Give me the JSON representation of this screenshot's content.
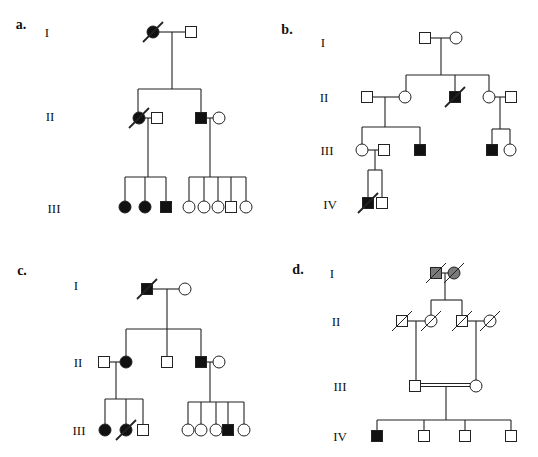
{
  "figure": {
    "colors": {
      "line": "#222222",
      "affected": "#111111",
      "carrier_gray": "#7a7a7a",
      "unaffected": "#ffffff"
    }
  },
  "panels": [
    {
      "id": "a",
      "label": "a.",
      "label_pos": [
        21,
        25
      ],
      "generations": [
        {
          "label": "I",
          "pos": [
            47,
            32
          ]
        },
        {
          "label": "II",
          "pos": [
            50,
            116
          ]
        },
        {
          "label": "III",
          "pos": [
            54,
            208
          ]
        }
      ],
      "individuals": [
        {
          "id": "a-I-1",
          "sex": "female",
          "affected": true,
          "deceased": true,
          "x": 153,
          "y": 32
        },
        {
          "id": "a-I-2",
          "sex": "male",
          "affected": false,
          "deceased": false,
          "x": 191,
          "y": 32
        },
        {
          "id": "a-II-1",
          "sex": "female",
          "affected": true,
          "deceased": true,
          "x": 139,
          "y": 118
        },
        {
          "id": "a-II-2",
          "sex": "male",
          "affected": false,
          "deceased": false,
          "x": 157,
          "y": 118
        },
        {
          "id": "a-II-3",
          "sex": "male",
          "affected": true,
          "deceased": false,
          "x": 201,
          "y": 118
        },
        {
          "id": "a-II-4",
          "sex": "female",
          "affected": false,
          "deceased": false,
          "x": 219,
          "y": 118
        },
        {
          "id": "a-III-1",
          "sex": "female",
          "affected": true,
          "deceased": false,
          "x": 125,
          "y": 207
        },
        {
          "id": "a-III-2",
          "sex": "female",
          "affected": true,
          "deceased": false,
          "x": 145,
          "y": 207
        },
        {
          "id": "a-III-3",
          "sex": "male",
          "affected": true,
          "deceased": false,
          "x": 166,
          "y": 207
        },
        {
          "id": "a-III-4",
          "sex": "female",
          "affected": false,
          "deceased": false,
          "x": 189,
          "y": 207
        },
        {
          "id": "a-III-5",
          "sex": "female",
          "affected": false,
          "deceased": false,
          "x": 204,
          "y": 207
        },
        {
          "id": "a-III-6",
          "sex": "female",
          "affected": false,
          "deceased": false,
          "x": 218,
          "y": 207
        },
        {
          "id": "a-III-7",
          "sex": "male",
          "affected": false,
          "deceased": false,
          "x": 231,
          "y": 207
        },
        {
          "id": "a-III-8",
          "sex": "female",
          "affected": false,
          "deceased": false,
          "x": 246,
          "y": 207
        }
      ],
      "lines": [
        [
          158,
          32,
          186,
          32
        ],
        [
          172,
          32,
          172,
          89
        ],
        [
          138,
          89,
          201,
          89
        ],
        [
          138,
          89,
          138,
          113
        ],
        [
          201,
          89,
          201,
          113
        ],
        [
          144,
          118,
          152,
          118
        ],
        [
          148,
          118,
          148,
          177
        ],
        [
          125,
          177,
          166,
          177
        ],
        [
          125,
          177,
          125,
          202
        ],
        [
          145,
          177,
          145,
          202
        ],
        [
          166,
          177,
          166,
          202
        ],
        [
          206,
          118,
          214,
          118
        ],
        [
          210,
          118,
          210,
          177
        ],
        [
          189,
          177,
          246,
          177
        ],
        [
          189,
          177,
          189,
          202
        ],
        [
          204,
          177,
          204,
          202
        ],
        [
          218,
          177,
          218,
          202
        ],
        [
          231,
          177,
          231,
          202
        ],
        [
          246,
          177,
          246,
          202
        ]
      ],
      "double_lines": []
    },
    {
      "id": "b",
      "label": "b.",
      "label_pos": [
        287,
        30
      ],
      "generations": [
        {
          "label": "I",
          "pos": [
            323,
            42
          ]
        },
        {
          "label": "II",
          "pos": [
            324,
            97
          ]
        },
        {
          "label": "III",
          "pos": [
            327,
            150
          ]
        },
        {
          "label": "IV",
          "pos": [
            330,
            204
          ]
        }
      ],
      "individuals": [
        {
          "id": "b-I-1",
          "sex": "male",
          "affected": false,
          "deceased": false,
          "x": 425,
          "y": 38
        },
        {
          "id": "b-I-2",
          "sex": "female",
          "affected": false,
          "deceased": false,
          "x": 456,
          "y": 38
        },
        {
          "id": "b-II-1",
          "sex": "male",
          "affected": false,
          "deceased": false,
          "x": 367,
          "y": 97
        },
        {
          "id": "b-II-2",
          "sex": "female",
          "affected": false,
          "deceased": false,
          "x": 405,
          "y": 97
        },
        {
          "id": "b-II-3",
          "sex": "male",
          "affected": true,
          "deceased": true,
          "x": 455,
          "y": 97
        },
        {
          "id": "b-II-4",
          "sex": "female",
          "affected": false,
          "deceased": false,
          "x": 489,
          "y": 97
        },
        {
          "id": "b-II-5",
          "sex": "male",
          "affected": false,
          "deceased": false,
          "x": 511,
          "y": 97
        },
        {
          "id": "b-III-1",
          "sex": "female",
          "affected": false,
          "deceased": false,
          "x": 362,
          "y": 150
        },
        {
          "id": "b-III-2",
          "sex": "male",
          "affected": false,
          "deceased": false,
          "x": 384,
          "y": 150
        },
        {
          "id": "b-III-3",
          "sex": "male",
          "affected": true,
          "deceased": false,
          "x": 420,
          "y": 150
        },
        {
          "id": "b-III-4",
          "sex": "male",
          "affected": true,
          "deceased": false,
          "x": 492,
          "y": 150
        },
        {
          "id": "b-III-5",
          "sex": "female",
          "affected": false,
          "deceased": false,
          "x": 510,
          "y": 150
        },
        {
          "id": "b-IV-1",
          "sex": "male",
          "affected": true,
          "deceased": true,
          "x": 368,
          "y": 203
        },
        {
          "id": "b-IV-2",
          "sex": "male",
          "affected": false,
          "deceased": false,
          "x": 382,
          "y": 203
        }
      ],
      "lines": [
        [
          430,
          38,
          451,
          38
        ],
        [
          441,
          38,
          441,
          75
        ],
        [
          406,
          75,
          489,
          75
        ],
        [
          406,
          75,
          406,
          92
        ],
        [
          455,
          75,
          455,
          92
        ],
        [
          489,
          75,
          489,
          92
        ],
        [
          372,
          97,
          400,
          97
        ],
        [
          385,
          97,
          385,
          127
        ],
        [
          362,
          127,
          420,
          127
        ],
        [
          362,
          127,
          362,
          145
        ],
        [
          420,
          127,
          420,
          145
        ],
        [
          494,
          97,
          506,
          97
        ],
        [
          500,
          97,
          500,
          129
        ],
        [
          492,
          129,
          510,
          129
        ],
        [
          492,
          129,
          492,
          145
        ],
        [
          510,
          129,
          510,
          145
        ],
        [
          367,
          150,
          379,
          150
        ],
        [
          375,
          150,
          375,
          170
        ],
        [
          368,
          170,
          382,
          170
        ],
        [
          368,
          170,
          368,
          198
        ],
        [
          382,
          170,
          382,
          198
        ]
      ],
      "double_lines": []
    },
    {
      "id": "c",
      "label": "c.",
      "label_pos": [
        22,
        271
      ],
      "generations": [
        {
          "label": "I",
          "pos": [
            76,
            285
          ]
        },
        {
          "label": "II",
          "pos": [
            78,
            362
          ]
        },
        {
          "label": "III",
          "pos": [
            79,
            430
          ]
        }
      ],
      "individuals": [
        {
          "id": "c-I-1",
          "sex": "male",
          "affected": true,
          "deceased": true,
          "x": 147,
          "y": 289
        },
        {
          "id": "c-I-2",
          "sex": "female",
          "affected": false,
          "deceased": false,
          "x": 185,
          "y": 289
        },
        {
          "id": "c-II-1",
          "sex": "male",
          "affected": false,
          "deceased": false,
          "x": 104,
          "y": 362
        },
        {
          "id": "c-II-2",
          "sex": "female",
          "affected": true,
          "deceased": false,
          "x": 126,
          "y": 362
        },
        {
          "id": "c-II-3",
          "sex": "male",
          "affected": false,
          "deceased": false,
          "x": 167,
          "y": 362
        },
        {
          "id": "c-II-4",
          "sex": "male",
          "affected": true,
          "deceased": false,
          "x": 201,
          "y": 362
        },
        {
          "id": "c-II-5",
          "sex": "female",
          "affected": false,
          "deceased": false,
          "x": 219,
          "y": 362
        },
        {
          "id": "c-III-1",
          "sex": "female",
          "affected": true,
          "deceased": false,
          "x": 105,
          "y": 430
        },
        {
          "id": "c-III-2",
          "sex": "female",
          "affected": true,
          "deceased": true,
          "x": 126,
          "y": 430
        },
        {
          "id": "c-III-3",
          "sex": "male",
          "affected": false,
          "deceased": false,
          "x": 143,
          "y": 430
        },
        {
          "id": "c-III-4",
          "sex": "female",
          "affected": false,
          "deceased": false,
          "x": 188,
          "y": 430
        },
        {
          "id": "c-III-5",
          "sex": "female",
          "affected": false,
          "deceased": false,
          "x": 201,
          "y": 430
        },
        {
          "id": "c-III-6",
          "sex": "female",
          "affected": false,
          "deceased": false,
          "x": 216,
          "y": 430
        },
        {
          "id": "c-III-7",
          "sex": "male",
          "affected": true,
          "deceased": false,
          "x": 228,
          "y": 430
        },
        {
          "id": "c-III-8",
          "sex": "female",
          "affected": false,
          "deceased": false,
          "x": 244,
          "y": 430
        }
      ],
      "lines": [
        [
          152,
          289,
          180,
          289
        ],
        [
          167,
          289,
          167,
          329
        ],
        [
          126,
          329,
          201,
          329
        ],
        [
          126,
          329,
          126,
          357
        ],
        [
          167,
          329,
          167,
          357
        ],
        [
          201,
          329,
          201,
          357
        ],
        [
          109,
          362,
          121,
          362
        ],
        [
          116,
          362,
          116,
          399
        ],
        [
          105,
          399,
          143,
          399
        ],
        [
          105,
          399,
          105,
          425
        ],
        [
          126,
          399,
          126,
          425
        ],
        [
          143,
          399,
          143,
          425
        ],
        [
          206,
          362,
          214,
          362
        ],
        [
          210,
          362,
          210,
          402
        ],
        [
          188,
          402,
          244,
          402
        ],
        [
          188,
          402,
          188,
          425
        ],
        [
          201,
          402,
          201,
          425
        ],
        [
          216,
          402,
          216,
          425
        ],
        [
          228,
          402,
          228,
          425
        ],
        [
          244,
          402,
          244,
          425
        ]
      ],
      "double_lines": []
    },
    {
      "id": "d",
      "label": "d.",
      "label_pos": [
        298,
        270
      ],
      "generations": [
        {
          "label": "I",
          "pos": [
            332,
            273
          ]
        },
        {
          "label": "II",
          "pos": [
            336,
            321
          ]
        },
        {
          "label": "III",
          "pos": [
            340,
            386
          ]
        },
        {
          "label": "IV",
          "pos": [
            340,
            436
          ]
        }
      ],
      "individuals": [
        {
          "id": "d-I-1",
          "sex": "male",
          "affected": "gray",
          "deceased": true,
          "x": 436,
          "y": 273
        },
        {
          "id": "d-I-2",
          "sex": "female",
          "affected": "gray",
          "deceased": true,
          "x": 454,
          "y": 273
        },
        {
          "id": "d-II-1",
          "sex": "male",
          "affected": false,
          "deceased": true,
          "x": 402,
          "y": 321
        },
        {
          "id": "d-II-2",
          "sex": "female",
          "affected": false,
          "deceased": true,
          "x": 431,
          "y": 321
        },
        {
          "id": "d-II-3",
          "sex": "male",
          "affected": false,
          "deceased": true,
          "x": 462,
          "y": 321
        },
        {
          "id": "d-II-4",
          "sex": "female",
          "affected": false,
          "deceased": true,
          "x": 490,
          "y": 321
        },
        {
          "id": "d-III-1",
          "sex": "male",
          "affected": false,
          "deceased": false,
          "x": 415,
          "y": 386
        },
        {
          "id": "d-III-2",
          "sex": "female",
          "affected": false,
          "deceased": false,
          "x": 476,
          "y": 386
        },
        {
          "id": "d-IV-1",
          "sex": "male",
          "affected": true,
          "deceased": false,
          "x": 377,
          "y": 436
        },
        {
          "id": "d-IV-2",
          "sex": "male",
          "affected": false,
          "deceased": false,
          "x": 424,
          "y": 436
        },
        {
          "id": "d-IV-3",
          "sex": "male",
          "affected": false,
          "deceased": false,
          "x": 465,
          "y": 436
        },
        {
          "id": "d-IV-4",
          "sex": "male",
          "affected": false,
          "deceased": false,
          "x": 511,
          "y": 436
        }
      ],
      "lines": [
        [
          441,
          273,
          449,
          273
        ],
        [
          445,
          273,
          445,
          300
        ],
        [
          431,
          300,
          462,
          300
        ],
        [
          431,
          300,
          431,
          316
        ],
        [
          462,
          300,
          462,
          316
        ],
        [
          407,
          321,
          426,
          321
        ],
        [
          416,
          321,
          416,
          381
        ],
        [
          467,
          321,
          485,
          321
        ],
        [
          476,
          321,
          476,
          381
        ],
        [
          446,
          387,
          446,
          420
        ],
        [
          377,
          420,
          511,
          420
        ],
        [
          377,
          420,
          377,
          431
        ],
        [
          424,
          420,
          424,
          431
        ],
        [
          465,
          420,
          465,
          431
        ],
        [
          511,
          420,
          511,
          431
        ]
      ],
      "double_lines": [
        [
          420,
          385,
          471,
          385
        ]
      ]
    }
  ]
}
